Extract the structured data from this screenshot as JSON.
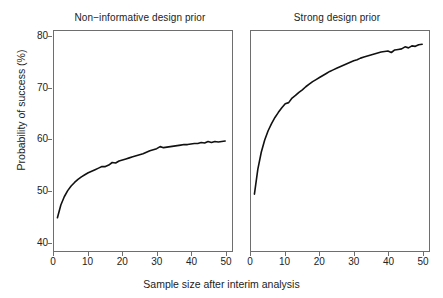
{
  "chart_data": {
    "type": "line",
    "title": "",
    "xlabel": "Sample size after interim analysis",
    "ylabel": "Probability of success (%)",
    "xlim": [
      0,
      52
    ],
    "ylim": [
      38,
      81
    ],
    "xticks": [
      0,
      10,
      20,
      30,
      40,
      50
    ],
    "yticks": [
      40,
      50,
      60,
      70,
      80
    ],
    "grid": false,
    "legend": null,
    "panels": [
      {
        "title": "Non−informative design prior",
        "series_name": "Probability of success",
        "x": [
          1,
          2,
          3,
          4,
          5,
          6,
          7,
          8,
          9,
          10,
          11,
          12,
          13,
          14,
          15,
          16,
          17,
          18,
          19,
          20,
          21,
          22,
          23,
          24,
          25,
          26,
          27,
          28,
          29,
          30,
          31,
          32,
          33,
          34,
          35,
          36,
          37,
          38,
          39,
          40,
          41,
          42,
          43,
          44,
          45,
          46,
          47,
          48,
          49,
          50
        ],
        "values": [
          44.5,
          47.0,
          48.6,
          49.8,
          50.7,
          51.4,
          52.0,
          52.5,
          52.9,
          53.3,
          53.6,
          53.9,
          54.2,
          54.5,
          54.5,
          54.8,
          55.3,
          55.2,
          55.6,
          55.8,
          56.0,
          56.2,
          56.4,
          56.6,
          56.8,
          57.0,
          57.3,
          57.6,
          57.8,
          58.0,
          58.4,
          58.2,
          58.3,
          58.4,
          58.5,
          58.6,
          58.7,
          58.8,
          58.8,
          58.9,
          59.0,
          59.0,
          59.2,
          59.1,
          59.4,
          59.2,
          59.4,
          59.3,
          59.4,
          59.5
        ]
      },
      {
        "title": "Strong design prior",
        "series_name": "Probability of success",
        "x": [
          1,
          2,
          3,
          4,
          5,
          6,
          7,
          8,
          9,
          10,
          11,
          12,
          13,
          14,
          15,
          16,
          17,
          18,
          19,
          20,
          21,
          22,
          23,
          24,
          25,
          26,
          27,
          28,
          29,
          30,
          31,
          32,
          33,
          34,
          35,
          36,
          37,
          38,
          39,
          40,
          41,
          42,
          43,
          44,
          45,
          46,
          47,
          48,
          49,
          50
        ],
        "values": [
          49.1,
          54.0,
          57.3,
          59.7,
          61.5,
          62.9,
          64.1,
          65.1,
          66.0,
          66.8,
          67.0,
          67.9,
          68.4,
          69.0,
          69.5,
          70.1,
          70.6,
          71.1,
          71.5,
          71.9,
          72.3,
          72.7,
          73.1,
          73.4,
          73.7,
          74.0,
          74.3,
          74.6,
          74.9,
          75.2,
          75.4,
          75.7,
          75.9,
          76.1,
          76.3,
          76.5,
          76.7,
          76.9,
          77.0,
          77.1,
          76.8,
          77.3,
          77.4,
          77.5,
          77.9,
          77.7,
          78.1,
          78.0,
          78.3,
          78.4
        ]
      }
    ]
  },
  "style": {
    "line_color": "#111111",
    "frame_color": "#6e6e6e",
    "background": "#ffffff"
  }
}
